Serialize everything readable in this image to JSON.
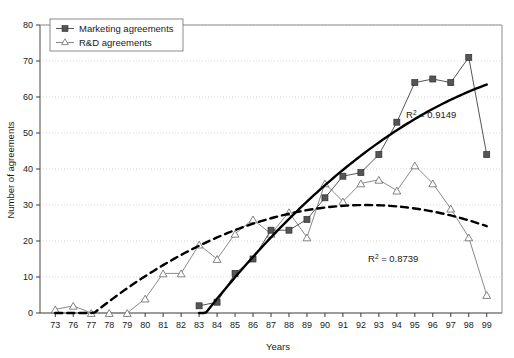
{
  "chart_data": {
    "type": "line",
    "title": "",
    "subtitle": "",
    "xlabel": "Years",
    "ylabel": "Number of agreements",
    "xlim": [
      0,
      26
    ],
    "ylim": [
      0,
      80
    ],
    "yticks": [
      0,
      10,
      20,
      30,
      40,
      50,
      60,
      70,
      80
    ],
    "grid": true,
    "grid_axis": "y",
    "legend_position": "top-left",
    "categories": [
      "73",
      "76",
      "77",
      "78",
      "79",
      "80",
      "81",
      "82",
      "83",
      "84",
      "85",
      "86",
      "87",
      "88",
      "89",
      "90",
      "91",
      "92",
      "93",
      "94",
      "95",
      "96",
      "97",
      "98",
      "99"
    ],
    "series": [
      {
        "name": "Marketing agreements",
        "marker": "filled-square",
        "line_style": "solid",
        "color": "#555555",
        "values": [
          null,
          null,
          null,
          null,
          null,
          null,
          null,
          null,
          2,
          3,
          11,
          15,
          23,
          23,
          26,
          32,
          38,
          39,
          44,
          53,
          64,
          65,
          64,
          71,
          44
        ]
      },
      {
        "name": "R&D agreements",
        "marker": "open-triangle",
        "line_style": "solid",
        "color": "#8a8a8a",
        "values": [
          1,
          2,
          0,
          0,
          0,
          4,
          11,
          11,
          19,
          15,
          22,
          26,
          22,
          28,
          21,
          36,
          31,
          36,
          37,
          34,
          41,
          36,
          29,
          21,
          5
        ]
      }
    ],
    "trendlines": [
      {
        "name": "Marketing trendline",
        "style": "solid-thick",
        "label": "R² = 0.9149",
        "r_squared": "0.9149",
        "label_base": "R",
        "label_sup": "2",
        "label_rest": " = 0.9149"
      },
      {
        "name": "R&D trendline",
        "style": "dashed-thick",
        "label": "R² = 0.8739",
        "r_squared": "0.8739",
        "label_base": "R",
        "label_sup": "2",
        "label_rest": " = 0.8739"
      }
    ]
  },
  "legend": {
    "items": [
      {
        "label": "Marketing agreements"
      },
      {
        "label": "R&D agreements"
      }
    ]
  },
  "axes": {
    "y_title": "Number of agreements",
    "x_title": "Years",
    "y_ticks": [
      "0",
      "10",
      "20",
      "30",
      "40",
      "50",
      "60",
      "70",
      "80"
    ],
    "x_ticks": [
      "73",
      "76",
      "77",
      "78",
      "79",
      "80",
      "81",
      "82",
      "83",
      "84",
      "85",
      "86",
      "87",
      "88",
      "89",
      "90",
      "91",
      "92",
      "93",
      "94",
      "95",
      "96",
      "97",
      "98",
      "99"
    ]
  },
  "annotations": {
    "marketing_r2_base": "R",
    "marketing_r2_sup": "2",
    "marketing_r2_rest": " = 0.9149",
    "rd_r2_base": "R",
    "rd_r2_sup": "2",
    "rd_r2_rest": " = 0.8739"
  },
  "colors": {
    "marketing": "#555555",
    "rd": "#8a8a8a",
    "axis": "#8c8c8c",
    "grid": "#cfcfcf",
    "text": "#1a1a1a",
    "trend": "#000000"
  }
}
